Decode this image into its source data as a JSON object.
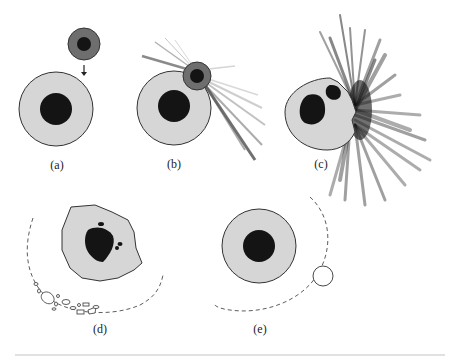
{
  "figure": {
    "panels": [
      {
        "id": "a",
        "label": "(a)",
        "description": "Small impactor with core approaching large body with core"
      },
      {
        "id": "b",
        "label": "(b)",
        "description": "Impactor grazes body, ejecta spray outward"
      },
      {
        "id": "c",
        "label": "(c)",
        "description": "Disrupted body with displaced core fragments and large ejecta plume"
      },
      {
        "id": "d",
        "label": "(d)",
        "description": "Irregular merged body with debris ring of fragments"
      },
      {
        "id": "e",
        "label": "(e)",
        "description": "Body with orbiting moonlet on dashed orbit"
      }
    ],
    "colors": {
      "mantle": "#d6d6d6",
      "core": "#141414",
      "impactor_mantle": "#6e6e6e",
      "outline": "#333333",
      "ejecta": "#222222"
    },
    "caption_fragment": ""
  }
}
